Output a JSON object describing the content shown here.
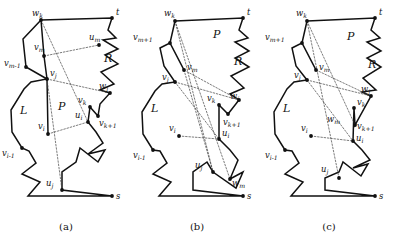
{
  "figure": {
    "title": "",
    "panel_count": 3,
    "background": "#ffffff",
    "line_color": "#111111",
    "chord_color": "#444444"
  },
  "panels": [
    {
      "id": "a",
      "caption": "(a)",
      "regions": [
        {
          "name": "L",
          "x": 20,
          "y": 114
        },
        {
          "name": "P",
          "x": 58,
          "y": 110
        },
        {
          "name": "R",
          "x": 104,
          "y": 62
        }
      ],
      "labels": [
        {
          "base": "w",
          "sub": "k",
          "x": 32,
          "y": 16
        },
        {
          "base": "t",
          "sub": "",
          "x": 116,
          "y": 15
        },
        {
          "base": "u",
          "sub": "m",
          "x": 89,
          "y": 40
        },
        {
          "base": "v",
          "sub": "m",
          "x": 34,
          "y": 50
        },
        {
          "base": "v",
          "sub": "m-1",
          "x": 8,
          "y": 66
        },
        {
          "base": "v",
          "sub": "j",
          "x": 50,
          "y": 76
        },
        {
          "base": "w",
          "sub": "j",
          "x": 101,
          "y": 89
        },
        {
          "base": "v",
          "sub": "k",
          "x": 80,
          "y": 103
        },
        {
          "base": "v",
          "sub": "k+1",
          "x": 101,
          "y": 122
        },
        {
          "base": "u",
          "sub": "i",
          "x": 78,
          "y": 118
        },
        {
          "base": "v",
          "sub": "i",
          "x": 40,
          "y": 129
        },
        {
          "base": "v",
          "sub": "i-1",
          "x": 6,
          "y": 150
        },
        {
          "base": "u",
          "sub": "j",
          "x": 47,
          "y": 186
        }
      ],
      "vertices": [
        {
          "name": "w_k",
          "x": 41,
          "y": 20
        },
        {
          "name": "t",
          "x": 112,
          "y": 18
        },
        {
          "name": "u_m",
          "x": 99,
          "y": 45
        },
        {
          "name": "v_m",
          "x": 44,
          "y": 56
        },
        {
          "name": "v_m-1",
          "x": 26,
          "y": 67
        },
        {
          "name": "v_j",
          "x": 47,
          "y": 79
        },
        {
          "name": "w_j",
          "x": 110,
          "y": 93
        },
        {
          "name": "v_k",
          "x": 90,
          "y": 107
        },
        {
          "name": "v_k+1",
          "x": 98,
          "y": 116
        },
        {
          "name": "u_i",
          "x": 88,
          "y": 122
        },
        {
          "name": "v_i",
          "x": 48,
          "y": 134
        },
        {
          "name": "v_i-1",
          "x": 22,
          "y": 148
        },
        {
          "name": "u_j",
          "x": 62,
          "y": 190
        },
        {
          "name": "s",
          "x": 112,
          "y": 196
        }
      ],
      "outer_boundary": "M41,20 L112,18 L108,30 L116,38 L103,40 L118,49 L105,55 L118,64 L101,72 L114,84 L100,90 L110,93 L100,104 L98,116 L90,107 L88,122 L96,132 L103,143 L88,154 L105,150 L98,162 L80,148 L76,162 L62,172 L62,190 L112,196 L28,196 L40,182 L22,174 L36,163 L29,151 L22,148 L12,132 L11,110 L24,89 L31,82 L47,79 L26,67 L23,39 Z",
      "inner_chain": "M41,20 L44,56 L47,79 L48,134",
      "chords": [
        {
          "from": "w_k",
          "to": "u_i",
          "path": "M41,20 L88,122"
        },
        {
          "from": "v_m",
          "to": "u_m",
          "path": "M44,56 L99,45"
        },
        {
          "from": "v_j",
          "to": "w_j",
          "path": "M47,79 L110,93"
        },
        {
          "from": "v_i",
          "to": "u_i",
          "path": "M48,134 L88,122"
        },
        {
          "from": "v_j",
          "to": "u_j",
          "path": "M47,79 L62,190"
        },
        {
          "from": "v_m",
          "to": "v_j",
          "path": "M44,56 L47,79"
        }
      ],
      "solid_chain": []
    },
    {
      "id": "b",
      "caption": "(b)",
      "regions": [
        {
          "name": "L",
          "x": 20,
          "y": 112
        },
        {
          "name": "P",
          "x": 82,
          "y": 38
        },
        {
          "name": "R",
          "x": 103,
          "y": 65
        }
      ],
      "labels": [
        {
          "base": "w",
          "sub": "k",
          "x": 33,
          "y": 16
        },
        {
          "base": "t",
          "sub": "",
          "x": 116,
          "y": 15
        },
        {
          "base": "v",
          "sub": "m+1",
          "x": 3,
          "y": 40
        },
        {
          "base": "v",
          "sub": "m",
          "x": 47,
          "y": 67
        },
        {
          "base": "v",
          "sub": "j",
          "x": 33,
          "y": 88
        },
        {
          "base": "w",
          "sub": "j",
          "x": 101,
          "y": 99
        },
        {
          "base": "v",
          "sub": "k",
          "x": 78,
          "y": 101
        },
        {
          "base": "v",
          "sub": "k+1",
          "x": 94,
          "y": 119
        },
        {
          "base": "u",
          "sub": "i",
          "x": 93,
          "y": 134
        },
        {
          "base": "v",
          "sub": "i",
          "x": 42,
          "y": 131
        },
        {
          "base": "v",
          "sub": "i-1",
          "x": 6,
          "y": 152
        },
        {
          "base": "u",
          "sub": "j",
          "x": 65,
          "y": 167
        },
        {
          "base": "w",
          "sub": "m",
          "x": 103,
          "y": 173
        }
      ],
      "vertices": [
        {
          "name": "w_k",
          "x": 44,
          "y": 21
        },
        {
          "name": "t",
          "x": 112,
          "y": 18
        },
        {
          "name": "v_m+1",
          "x": 39,
          "y": 43
        },
        {
          "name": "v_m",
          "x": 53,
          "y": 70
        },
        {
          "name": "v_j",
          "x": 44,
          "y": 82
        },
        {
          "name": "w_j",
          "x": 108,
          "y": 100
        },
        {
          "name": "v_k",
          "x": 88,
          "y": 105
        },
        {
          "name": "v_k+1",
          "x": 97,
          "y": 114
        },
        {
          "name": "u_i",
          "x": 88,
          "y": 139
        },
        {
          "name": "v_i",
          "x": 48,
          "y": 136
        },
        {
          "name": "v_i-1",
          "x": 22,
          "y": 150
        },
        {
          "name": "u_j",
          "x": 82,
          "y": 172
        },
        {
          "name": "w_m",
          "x": 99,
          "y": 179
        },
        {
          "name": "s",
          "x": 112,
          "y": 196
        }
      ],
      "outer_boundary": "M44,21 L112,18 L108,30 L117,38 L104,42 L118,51 L104,58 L118,67 L100,76 L113,88 L99,94 L108,100 L97,114 L88,105 L88,139 L99,150 L107,160 L99,179 L112,172 L105,188 L82,172 L76,162 L62,172 L62,190 L112,196 L28,196 L40,182 L22,174 L36,163 L29,151 L22,150 L12,134 L11,112 L24,91 L31,84 L44,82 L33,66 L29,48 L39,43 Z",
      "chords": [
        {
          "from": "w_k",
          "to": "w_m",
          "path": "M44,21 L99,179"
        },
        {
          "from": "w_k",
          "to": "u_j",
          "path": "M44,21 L82,172"
        },
        {
          "from": "v_j",
          "to": "w_j",
          "path": "M44,82 L108,100"
        },
        {
          "from": "v_j",
          "to": "u_i",
          "path": "M44,82 L88,139"
        },
        {
          "from": "v_i",
          "to": "u_i",
          "path": "M48,136 L88,139"
        },
        {
          "from": "v_m",
          "to": "u_j",
          "path": "M53,70 L82,172"
        },
        {
          "from": "v_m",
          "to": "w_j",
          "path": "M53,70 L108,100"
        }
      ],
      "solid_chain": [
        "M39,43 L53,70"
      ]
    },
    {
      "id": "c",
      "caption": "(c)",
      "regions": [
        {
          "name": "L",
          "x": 20,
          "y": 112
        },
        {
          "name": "P",
          "x": 84,
          "y": 40
        },
        {
          "name": "R",
          "x": 105,
          "y": 68
        }
      ],
      "labels": [
        {
          "base": "w",
          "sub": "k",
          "x": 33,
          "y": 16
        },
        {
          "base": "t",
          "sub": "",
          "x": 116,
          "y": 15
        },
        {
          "base": "v",
          "sub": "m+1",
          "x": 3,
          "y": 40
        },
        {
          "base": "v",
          "sub": "m",
          "x": 49,
          "y": 67
        },
        {
          "base": "v",
          "sub": "j",
          "x": 33,
          "y": 86
        },
        {
          "base": "w",
          "sub": "j",
          "x": 100,
          "y": 92
        },
        {
          "base": "v",
          "sub": "k",
          "x": 93,
          "y": 104
        },
        {
          "base": "w",
          "sub": "m",
          "x": 66,
          "y": 122
        },
        {
          "base": "v",
          "sub": "k+1",
          "x": 93,
          "y": 128
        },
        {
          "base": "u",
          "sub": "i",
          "x": 95,
          "y": 141
        },
        {
          "base": "v",
          "sub": "i",
          "x": 42,
          "y": 131
        },
        {
          "base": "v",
          "sub": "i-1",
          "x": 6,
          "y": 152
        },
        {
          "base": "u",
          "sub": "j",
          "x": 60,
          "y": 172
        }
      ],
      "vertices": [
        {
          "name": "w_k",
          "x": 44,
          "y": 21
        },
        {
          "name": "t",
          "x": 112,
          "y": 18
        },
        {
          "name": "v_m+1",
          "x": 39,
          "y": 43
        },
        {
          "name": "v_m",
          "x": 53,
          "y": 70
        },
        {
          "name": "v_j",
          "x": 44,
          "y": 80
        },
        {
          "name": "w_j",
          "x": 108,
          "y": 96
        },
        {
          "name": "v_k",
          "x": 91,
          "y": 108
        },
        {
          "name": "v_k+1",
          "x": 92,
          "y": 125
        },
        {
          "name": "u_i",
          "x": 90,
          "y": 141
        },
        {
          "name": "v_i",
          "x": 48,
          "y": 136
        },
        {
          "name": "v_i-1",
          "x": 22,
          "y": 150
        },
        {
          "name": "u_j",
          "x": 76,
          "y": 178
        },
        {
          "name": "s",
          "x": 112,
          "y": 196
        }
      ],
      "outer_boundary": "M44,21 L112,18 L108,30 L117,38 L104,42 L118,51 L104,58 L118,67 L100,78 L113,90 L99,92 L108,96 L92,125 L91,108 L90,141 L99,150 L107,160 L90,168 L105,164 L98,176 L80,162 L76,172 L62,178 L62,190 L112,196 L28,196 L40,182 L22,174 L36,163 L29,151 L22,150 L12,134 L11,112 L24,89 L31,82 L44,80 L33,66 L29,48 L39,43 Z",
      "chords": [
        {
          "from": "w_k",
          "to": "u_j",
          "path": "M44,21 L76,178"
        },
        {
          "from": "w_k",
          "to": "v_k+1",
          "path": "M44,21 L92,125"
        },
        {
          "from": "v_j",
          "to": "w_j",
          "path": "M44,80 L108,96"
        },
        {
          "from": "v_j",
          "to": "u_i",
          "path": "M44,80 L90,141"
        },
        {
          "from": "v_i",
          "to": "u_i",
          "path": "M48,136 L90,141"
        },
        {
          "from": "v_m",
          "to": "w_j",
          "path": "M53,70 L108,96"
        }
      ],
      "solid_chain": [
        "M39,43 L53,70"
      ]
    }
  ]
}
